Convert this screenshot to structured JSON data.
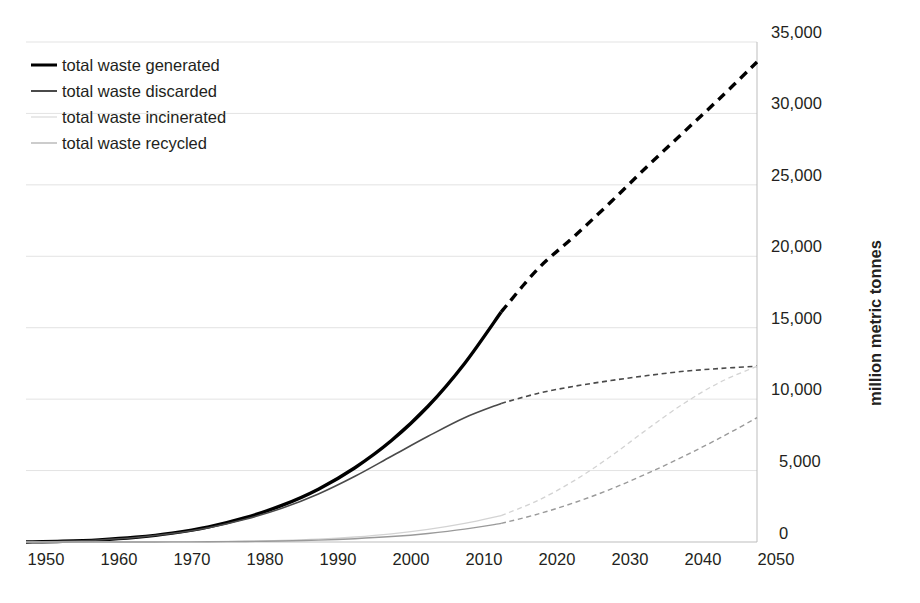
{
  "chart_data": {
    "type": "line",
    "title": "",
    "subtitle": "",
    "xlabel": "",
    "ylabel": "million metric tonnes",
    "xlim": [
      1950,
      2050
    ],
    "ylim": [
      0,
      35000
    ],
    "grid": true,
    "grid_axis": "y",
    "legend_position": "top-left",
    "x_ticks": [
      "1950",
      "1960",
      "1970",
      "1980",
      "1990",
      "2000",
      "2010",
      "2020",
      "2030",
      "2040",
      "2050"
    ],
    "y_ticks": [
      "0",
      "5,000",
      "10,000",
      "15,000",
      "20,000",
      "25,000",
      "30,000",
      "35,000"
    ],
    "y_axis_side": "right",
    "historical_end_year": 2015,
    "note": "Solid segment = historical (1950-2015); dashed segment = projection (2015-2050)",
    "x": [
      1950,
      1955,
      1960,
      1965,
      1970,
      1975,
      1980,
      1985,
      1990,
      1995,
      2000,
      2005,
      2010,
      2015,
      2020,
      2025,
      2030,
      2035,
      2040,
      2045,
      2050
    ],
    "series": [
      {
        "name": "total waste generated",
        "color": "#000000",
        "width": 3.4,
        "values": [
          2,
          50,
          150,
          330,
          620,
          1060,
          1700,
          2560,
          3700,
          5200,
          7100,
          9500,
          12500,
          16100,
          19100,
          21400,
          23800,
          26300,
          28700,
          31100,
          33600
        ]
      },
      {
        "name": "total waste discarded",
        "color": "#4a4a4a",
        "width": 1.6,
        "values": [
          2,
          48,
          145,
          315,
          590,
          1000,
          1590,
          2360,
          3360,
          4600,
          6000,
          7400,
          8700,
          9700,
          10400,
          10900,
          11300,
          11650,
          11950,
          12150,
          12300
        ]
      },
      {
        "name": "total waste incinerated",
        "color": "#d3d3d3",
        "width": 1.3,
        "values": [
          0,
          0,
          2,
          6,
          14,
          30,
          60,
          110,
          200,
          350,
          570,
          880,
          1300,
          1850,
          2900,
          4300,
          6000,
          7900,
          9700,
          11200,
          12300
        ]
      },
      {
        "name": "total waste recycled",
        "color": "#9a9a9a",
        "width": 1.4,
        "values": [
          0,
          0,
          1,
          3,
          8,
          18,
          38,
          72,
          130,
          230,
          380,
          600,
          900,
          1300,
          1950,
          2750,
          3700,
          4800,
          6000,
          7300,
          8700
        ]
      }
    ]
  },
  "axes": {
    "y_title": "million metric tonnes",
    "y_ticks": [
      {
        "label": "35,000"
      },
      {
        "label": "30,000"
      },
      {
        "label": "25,000"
      },
      {
        "label": "20,000"
      },
      {
        "label": "15,000"
      },
      {
        "label": "10,000"
      },
      {
        "label": "5,000"
      },
      {
        "label": "0"
      }
    ],
    "x_ticks": [
      {
        "label": "1950"
      },
      {
        "label": "1960"
      },
      {
        "label": "1970"
      },
      {
        "label": "1980"
      },
      {
        "label": "1990"
      },
      {
        "label": "2000"
      },
      {
        "label": "2010"
      },
      {
        "label": "2020"
      },
      {
        "label": "2030"
      },
      {
        "label": "2040"
      },
      {
        "label": "2050"
      }
    ]
  },
  "legend": {
    "items": [
      {
        "label": "total waste generated"
      },
      {
        "label": "total waste discarded"
      },
      {
        "label": "total waste incinerated"
      },
      {
        "label": "total waste recycled"
      }
    ]
  },
  "caption": {
    "text": ""
  }
}
